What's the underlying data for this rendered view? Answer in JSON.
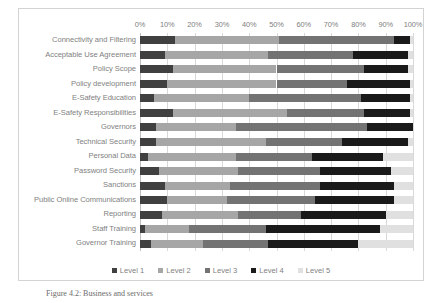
{
  "chart_data": {
    "type": "bar",
    "orientation": "horizontal",
    "stacked": true,
    "stack_mode": "percent",
    "title": "",
    "subtitle": "",
    "xlabel": "",
    "ylabel": "",
    "xlim": [
      0,
      100
    ],
    "grid": true,
    "axis_position": "top",
    "legend_position": "bottom",
    "x_tick_labels": [
      "0%",
      "10%",
      "20%",
      "30%",
      "40%",
      "50%",
      "60%",
      "70%",
      "80%",
      "90%",
      "100%"
    ],
    "x_tick_values": [
      0,
      10,
      20,
      30,
      40,
      50,
      60,
      70,
      80,
      90,
      100
    ],
    "categories": [
      "Connectivity and Filtering",
      "Acceptable Use Agreement",
      "Policy Scope",
      "Policy development",
      "E-Safety Education",
      "E-Safety Responsibilities",
      "Governors",
      "Technical Security",
      "Personal Data",
      "Password Security",
      "Sanctions",
      "Public Online Communications",
      "Reporting",
      "Staff Training",
      "Governor Training"
    ],
    "series": [
      {
        "name": "Level 1",
        "color": "#404040",
        "values": [
          13,
          9,
          12,
          10,
          5,
          12,
          6,
          6,
          3,
          7,
          9,
          10,
          8,
          2,
          4
        ]
      },
      {
        "name": "Level 2",
        "color": "#a6a6a6",
        "values": [
          38,
          38,
          38,
          40,
          35,
          42,
          29,
          40,
          32,
          29,
          24,
          22,
          28,
          16,
          19
        ]
      },
      {
        "name": "Level 3",
        "color": "#737373",
        "values": [
          42,
          31,
          32,
          26,
          41,
          28,
          48,
          28,
          28,
          30,
          33,
          32,
          23,
          28,
          24
        ]
      },
      {
        "name": "Level 4",
        "color": "#1a1a1a",
        "values": [
          6,
          20,
          16,
          23,
          18,
          17,
          17,
          24,
          26,
          26,
          27,
          29,
          31,
          42,
          33
        ]
      },
      {
        "name": "Level 5",
        "color": "#e0e0e0",
        "values": [
          1,
          2,
          2,
          1,
          1,
          1,
          0,
          2,
          11,
          8,
          7,
          7,
          10,
          12,
          20
        ]
      }
    ]
  },
  "legend": {
    "items": [
      {
        "label": "Level 1",
        "color": "#404040"
      },
      {
        "label": "Level 2",
        "color": "#a6a6a6"
      },
      {
        "label": "Level 3",
        "color": "#737373"
      },
      {
        "label": "Level 4",
        "color": "#1a1a1a"
      },
      {
        "label": "Level 5",
        "color": "#e0e0e0"
      }
    ]
  },
  "caption": {
    "text": "Figure 4.2: Business and services"
  },
  "colors": {
    "frame_border": "#d3d3d3",
    "gridline": "#d9d9d9",
    "label_text": "#7f7f7f",
    "background": "#ffffff"
  }
}
